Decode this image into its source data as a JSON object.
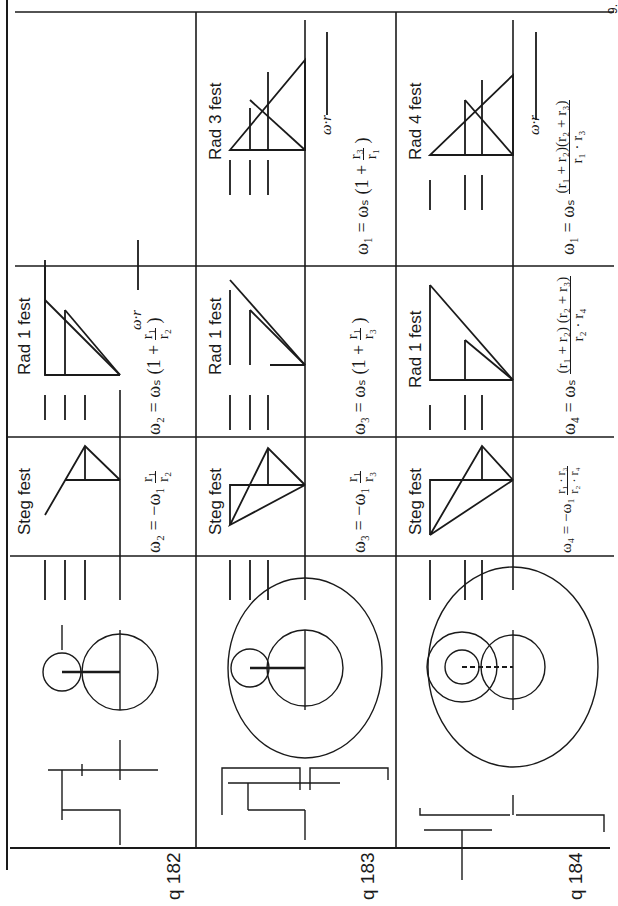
{
  "page": {
    "orientation": "rotated-90-ccw",
    "corner_mark": "9."
  },
  "rows": [
    {
      "id": "q182",
      "label": "q 182",
      "gear_numbers": {
        "sun": "1",
        "planet": "2",
        "carrier": "s"
      },
      "cases": [
        {
          "title": "Steg fest",
          "formula_text": "ω2 = −ω1 · r1/r2",
          "lhs": "ω₂ = −ω₁",
          "num": "r₁",
          "den": "r₂",
          "diagram_labels": [
            "2",
            "s",
            "1"
          ]
        },
        {
          "title": "Rad 1 fest",
          "formula_text": "ω2 = ωs (1 + r1/r2)",
          "lhs": "ω₂ = ωₛ (1 +",
          "num": "r₁",
          "den": "r₂",
          "rhs": ")",
          "axis_label": "ω·r",
          "diagram_labels": [
            "2",
            "s",
            "1"
          ]
        }
      ]
    },
    {
      "id": "q183",
      "label": "q 183",
      "gear_numbers": {
        "sun": "1",
        "planet": "2",
        "ring": "3",
        "carrier": "s"
      },
      "cases": [
        {
          "title": "Steg fest",
          "formula_text": "ω3 = −ω1 · r1/r3",
          "lhs": "ω₃ = −ω₁",
          "num": "r₁",
          "den": "r₃",
          "diagram_labels": [
            "2",
            "s",
            "1",
            "3"
          ]
        },
        {
          "title": "Rad 1 fest",
          "formula_text": "ω3 = ωs (1 + r1/r3)",
          "lhs": "ω₃ = ωₛ (1 +",
          "num": "r₁",
          "den": "r₃",
          "rhs": ")",
          "diagram_labels": [
            "3",
            "s",
            "1"
          ]
        },
        {
          "title": "Rad 3 fest",
          "formula_text": "ω1 = ωs (1 + r3/r1)",
          "lhs": "ω₁ = ωₛ (1 +",
          "num": "r₃",
          "den": "r₁",
          "rhs": ")",
          "axis_label": "ω·r",
          "diagram_labels": [
            "2",
            "s",
            "1",
            "3"
          ]
        }
      ]
    },
    {
      "id": "q184",
      "label": "q 184",
      "gear_numbers": {
        "sun": "1",
        "planet_a": "2",
        "planet_b": "3",
        "ring": "4",
        "carrier": "s"
      },
      "cases": [
        {
          "title": "Steg fest",
          "formula_text": "ω4 = −ω1 · (r1·r3)/(r2·r4)",
          "lhs": "ω₄ = −ω₁",
          "num": "r₁ · r₃",
          "den": "r₂ · r₄",
          "diagram_labels": [
            "2, 3",
            "s",
            "1",
            "4"
          ]
        },
        {
          "title": "Rad 1 fest",
          "formula_text": "ω4 = ωs · (r1 + r2)(r2 + r3)/(r2·r4)",
          "lhs": "ω₄ = ωₛ",
          "num": "(r₁ + r₂) (r₂ + r₃)",
          "den": "r₂ · r₄",
          "diagram_labels": [
            "2, 3",
            "4",
            "s",
            "1"
          ]
        },
        {
          "title": "Rad 4 fest",
          "formula_text": "ω1 = ωs · (r1 + r2)(r2 + r3)/(r1·r3)",
          "lhs": "ω₁ = ωₛ",
          "num": "(r₁ + r₂)(r₂ + r₃)",
          "den": "r₁ · r₃",
          "axis_label": "ω·r",
          "diagram_labels": [
            "2, 3",
            "s",
            "1",
            "4"
          ]
        }
      ]
    }
  ]
}
